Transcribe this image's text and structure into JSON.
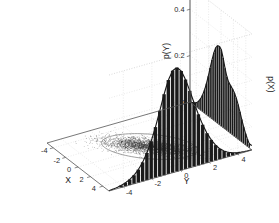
{
  "figure": {
    "title": "",
    "background_color": "#ffffff",
    "ink_color": "#1a1a1a",
    "grid_color": "#c9c9c9",
    "axis_color": "#555555",
    "scatter_color": "#303030",
    "ellipse_color": "#777777"
  },
  "axes": {
    "x": {
      "name": "X",
      "ticks": [
        "-4",
        "-2",
        "0",
        "2",
        "4"
      ],
      "values": [
        -4,
        -2,
        0,
        2,
        4
      ],
      "range": [
        -5,
        5
      ]
    },
    "y": {
      "name": "Y",
      "ticks": [
        "-4",
        "-2",
        "0",
        "2",
        "4"
      ],
      "values": [
        -4,
        -2,
        0,
        2,
        4
      ],
      "range": [
        -5,
        5
      ]
    },
    "z_left": {
      "name": "p(Y)",
      "ticks": [
        "0",
        "0.2",
        "0.4"
      ],
      "values": [
        0,
        0.2,
        0.4
      ],
      "range": [
        0,
        0.5
      ]
    },
    "z_right": {
      "name": "p(X)",
      "ticks": [],
      "values": [],
      "range": [
        0,
        0.5
      ]
    }
  },
  "chart_data": {
    "type": "scatter",
    "title": "",
    "xlabel": "X",
    "ylabel": "Y",
    "zlabel_left": "p(Y)",
    "zlabel_right": "p(X)",
    "xlim": [
      -5,
      5
    ],
    "ylim": [
      -5,
      5
    ],
    "zlim": [
      0,
      0.5
    ],
    "grid": true,
    "legend": "none",
    "projection": "3d",
    "scatter": {
      "n_points": 3000,
      "mean": [
        0,
        0
      ],
      "cov": [
        [
          2.2,
          1.25
        ],
        [
          1.25,
          1.1
        ]
      ],
      "ellipse": {
        "center": [
          0,
          0
        ],
        "semi_major": 3.6,
        "semi_minor": 1.75,
        "angle_deg": 30
      }
    },
    "marginal_p_y": {
      "wall": "left",
      "axis_name": "p(Y)",
      "bin_centers": [
        -4.75,
        -4.45,
        -4.15,
        -3.85,
        -3.55,
        -3.25,
        -2.95,
        -2.65,
        -2.35,
        -2.05,
        -1.75,
        -1.45,
        -1.15,
        -0.85,
        -0.55,
        -0.25,
        0.05,
        0.35,
        0.65,
        0.95,
        1.25,
        1.55,
        1.85,
        2.15,
        2.45,
        2.75,
        3.05,
        3.35,
        3.65,
        3.95,
        4.25,
        4.55
      ],
      "bin_heights": [
        0.004,
        0.008,
        0.014,
        0.022,
        0.035,
        0.052,
        0.074,
        0.101,
        0.134,
        0.172,
        0.214,
        0.255,
        0.292,
        0.32,
        0.335,
        0.338,
        0.33,
        0.3,
        0.262,
        0.232,
        0.214,
        0.206,
        0.198,
        0.188,
        0.172,
        0.15,
        0.124,
        0.097,
        0.072,
        0.05,
        0.032,
        0.018
      ],
      "curve_peak": 0.345,
      "curve_peak_at": -0.25
    },
    "marginal_p_x": {
      "wall": "right",
      "axis_name": "p(X)",
      "bin_centers": [
        -4.75,
        -4.45,
        -4.15,
        -3.85,
        -3.55,
        -3.25,
        -2.95,
        -2.65,
        -2.35,
        -2.05,
        -1.75,
        -1.45,
        -1.15,
        -0.85,
        -0.55,
        -0.25,
        0.05,
        0.35,
        0.65,
        0.95,
        1.25,
        1.55,
        1.85,
        2.15,
        2.45,
        2.75,
        3.05,
        3.35,
        3.65,
        3.95,
        4.25,
        4.55
      ],
      "bin_heights": [
        0.003,
        0.005,
        0.009,
        0.015,
        0.024,
        0.037,
        0.056,
        0.082,
        0.117,
        0.162,
        0.218,
        0.283,
        0.349,
        0.405,
        0.44,
        0.448,
        0.428,
        0.386,
        0.332,
        0.275,
        0.22,
        0.17,
        0.128,
        0.094,
        0.066,
        0.045,
        0.03,
        0.019,
        0.012,
        0.007,
        0.004,
        0.002
      ],
      "curve_peak": 0.452,
      "curve_peak_at": -0.2
    }
  }
}
